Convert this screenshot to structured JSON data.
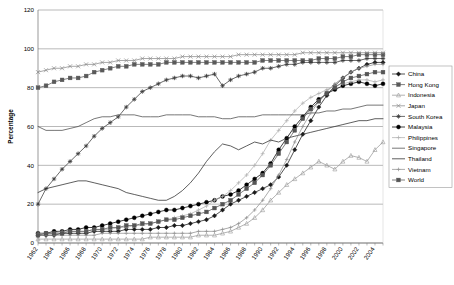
{
  "chart_data": {
    "type": "line",
    "title": "",
    "xlabel": "",
    "ylabel": "Percentage",
    "ylim": [
      0,
      120
    ],
    "ytick_step": 20,
    "yticks": [
      "0",
      "20",
      "40",
      "60",
      "80",
      "100",
      "120"
    ],
    "grid": true,
    "legend_position": "right",
    "x_start": 1962,
    "x_end": 2005,
    "xticks": [
      "1962",
      "1964",
      "1966",
      "1968",
      "1970",
      "1972",
      "1974",
      "1976",
      "1978",
      "1980",
      "1982",
      "1984",
      "1986",
      "1988",
      "1990",
      "1992",
      "1994",
      "1996",
      "1998",
      "2000",
      "2002",
      "2004"
    ],
    "x": [
      1962,
      1963,
      1964,
      1965,
      1966,
      1967,
      1968,
      1969,
      1970,
      1971,
      1972,
      1973,
      1974,
      1975,
      1976,
      1977,
      1978,
      1979,
      1980,
      1981,
      1982,
      1983,
      1984,
      1985,
      1986,
      1987,
      1988,
      1989,
      1990,
      1991,
      1992,
      1993,
      1994,
      1995,
      1996,
      1997,
      1998,
      1999,
      2000,
      2001,
      2002,
      2003,
      2004,
      2005
    ],
    "series": [
      {
        "name": "China",
        "marker": "diamond-filled",
        "color": "#1a1a1a",
        "values": [
          4,
          4,
          4,
          5,
          5,
          5,
          5,
          6,
          6,
          6,
          6,
          7,
          7,
          7,
          7,
          8,
          8,
          9,
          9,
          10,
          11,
          12,
          14,
          17,
          20,
          22,
          24,
          26,
          28,
          30,
          34,
          40,
          48,
          56,
          63,
          70,
          76,
          81,
          85,
          88,
          90,
          92,
          93,
          93
        ]
      },
      {
        "name": "Hong Kong",
        "marker": "square-filled",
        "color": "#5a5a5a",
        "values": [
          80,
          81,
          83,
          84,
          85,
          85,
          86,
          88,
          89,
          90,
          91,
          91,
          92,
          92,
          92,
          92,
          93,
          93,
          93,
          93,
          93,
          93,
          93,
          93,
          93,
          93,
          93,
          93,
          94,
          94,
          94,
          94,
          94,
          94,
          94,
          95,
          95,
          95,
          96,
          96,
          97,
          97,
          97,
          97
        ]
      },
      {
        "name": "Indonesia",
        "marker": "triangle-open",
        "color": "#9a9a9a",
        "values": [
          2,
          2,
          2,
          2,
          2,
          2,
          2,
          2,
          2,
          2,
          2,
          2,
          2,
          2,
          3,
          3,
          3,
          3,
          3,
          3,
          4,
          4,
          4,
          5,
          6,
          8,
          10,
          13,
          17,
          22,
          26,
          30,
          33,
          36,
          39,
          42,
          40,
          38,
          42,
          45,
          44,
          42,
          48,
          52
        ]
      },
      {
        "name": "Japan",
        "marker": "x-cross",
        "color": "#8a8a8a",
        "values": [
          88,
          89,
          90,
          90,
          91,
          91,
          92,
          92,
          93,
          93,
          94,
          94,
          94,
          95,
          95,
          95,
          95,
          95,
          96,
          96,
          96,
          96,
          96,
          96,
          96,
          97,
          97,
          97,
          97,
          97,
          97,
          97,
          97,
          98,
          98,
          98,
          98,
          98,
          98,
          98,
          98,
          98,
          98,
          98
        ]
      },
      {
        "name": "South Korea",
        "marker": "star-filled",
        "color": "#3a3a3a",
        "values": [
          20,
          28,
          33,
          38,
          42,
          46,
          50,
          55,
          59,
          62,
          65,
          70,
          74,
          78,
          80,
          82,
          84,
          85,
          86,
          86,
          85,
          86,
          87,
          81,
          84,
          86,
          87,
          88,
          90,
          90,
          91,
          92,
          92,
          93,
          93,
          93,
          93,
          93,
          94,
          94,
          94,
          95,
          95,
          95
        ]
      },
      {
        "name": "Malaysia",
        "marker": "circle-filled",
        "color": "#000000",
        "values": [
          5,
          5,
          6,
          6,
          7,
          7,
          8,
          8,
          9,
          10,
          11,
          12,
          13,
          14,
          15,
          16,
          17,
          17,
          18,
          19,
          20,
          21,
          22,
          24,
          25,
          27,
          30,
          33,
          36,
          41,
          48,
          54,
          60,
          65,
          70,
          74,
          77,
          79,
          81,
          82,
          83,
          82,
          81,
          82
        ]
      },
      {
        "name": "Philippines",
        "marker": "plus-open",
        "color": "#b0b0b0",
        "values": [
          5,
          5,
          5,
          6,
          6,
          6,
          6,
          7,
          7,
          7,
          8,
          8,
          9,
          9,
          10,
          11,
          12,
          13,
          14,
          15,
          17,
          19,
          22,
          24,
          27,
          31,
          35,
          40,
          46,
          53,
          58,
          63,
          68,
          72,
          75,
          77,
          79,
          81,
          82,
          83,
          84,
          84,
          83,
          84
        ]
      },
      {
        "name": "Singapore",
        "marker": "none",
        "color": "#4a4a4a",
        "values": [
          60,
          58,
          58,
          58,
          59,
          60,
          62,
          64,
          65,
          65,
          66,
          66,
          66,
          65,
          65,
          65,
          66,
          66,
          66,
          66,
          65,
          65,
          65,
          64,
          64,
          65,
          65,
          65,
          66,
          66,
          66,
          66,
          66,
          66,
          67,
          67,
          68,
          68,
          69,
          69,
          70,
          71,
          71,
          71
        ]
      },
      {
        "name": "Thailand",
        "marker": "none",
        "color": "#2a2a2a",
        "values": [
          26,
          28,
          29,
          30,
          31,
          32,
          32,
          31,
          30,
          29,
          28,
          26,
          25,
          24,
          23,
          22,
          22,
          24,
          27,
          31,
          36,
          42,
          47,
          51,
          50,
          48,
          50,
          52,
          51,
          53,
          52,
          54,
          55,
          56,
          57,
          58,
          59,
          60,
          61,
          62,
          63,
          63,
          64,
          64
        ]
      },
      {
        "name": "Vietnam",
        "marker": "tick-open",
        "color": "#909090",
        "values": [
          4,
          4,
          4,
          4,
          4,
          4,
          4,
          4,
          5,
          5,
          5,
          5,
          5,
          5,
          5,
          5,
          5,
          5,
          5,
          5,
          6,
          6,
          6,
          7,
          8,
          10,
          13,
          17,
          22,
          28,
          35,
          43,
          52,
          60,
          67,
          73,
          78,
          82,
          85,
          88,
          90,
          91,
          92,
          92
        ]
      },
      {
        "name": "World",
        "marker": "square-filled-dark",
        "color": "#555555",
        "values": [
          4,
          5,
          5,
          5,
          6,
          6,
          6,
          7,
          7,
          8,
          8,
          9,
          9,
          10,
          10,
          11,
          12,
          12,
          13,
          14,
          15,
          16,
          18,
          20,
          22,
          25,
          28,
          31,
          35,
          40,
          46,
          52,
          58,
          64,
          69,
          73,
          77,
          80,
          83,
          85,
          86,
          87,
          88,
          88
        ]
      }
    ]
  },
  "legend": {
    "items": [
      {
        "label": "China"
      },
      {
        "label": "Hong Kong"
      },
      {
        "label": "Indonesia"
      },
      {
        "label": "Japan"
      },
      {
        "label": "South Korea"
      },
      {
        "label": "Malaysia"
      },
      {
        "label": "Philippines"
      },
      {
        "label": "Singapore"
      },
      {
        "label": "Thailand"
      },
      {
        "label": "Vietnam"
      },
      {
        "label": "World"
      }
    ]
  }
}
